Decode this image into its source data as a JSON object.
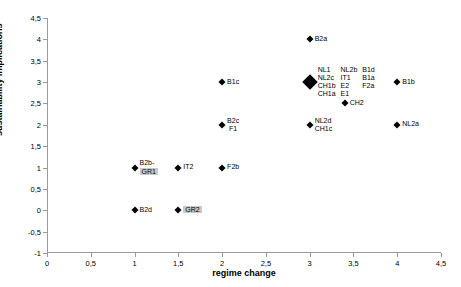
{
  "chart_data": {
    "type": "scatter",
    "title": "",
    "xlabel": "regime change",
    "ylabel": "sustainability implications",
    "xlim": [
      0,
      4.5
    ],
    "ylim": [
      -1,
      4.5
    ],
    "xticks": [
      "0",
      "0,5",
      "1",
      "1,5",
      "2",
      "2,5",
      "3",
      "3,5",
      "4",
      "4,5"
    ],
    "xtick_values": [
      0,
      0.5,
      1,
      1.5,
      2,
      2.5,
      3,
      3.5,
      4,
      4.5
    ],
    "yticks": [
      "4,5",
      "4",
      "3,5",
      "3",
      "2,5",
      "2",
      "1,5",
      "1",
      "0,5",
      "0",
      "-0,5",
      "-1"
    ],
    "ytick_values": [
      4.5,
      4,
      3.5,
      3,
      2.5,
      2,
      1.5,
      1,
      0.5,
      0,
      -0.5,
      -1
    ],
    "grid": false,
    "legend": "none",
    "points": [
      {
        "x": 3,
        "y": 4,
        "marker": "diamond",
        "labels": [
          [
            "B2a"
          ]
        ]
      },
      {
        "x": 3,
        "y": 3,
        "marker": "diamond-big",
        "labels": [
          [
            "NL1",
            "NL2c",
            "CH1b",
            "CH1a"
          ],
          [
            "NL2b",
            "IT1",
            "E2",
            "E1"
          ],
          [
            "B1d",
            "B1a",
            "F2a"
          ]
        ]
      },
      {
        "x": 2,
        "y": 3,
        "marker": "diamond",
        "labels": [
          [
            "B1c"
          ]
        ]
      },
      {
        "x": 4,
        "y": 3,
        "marker": "diamond",
        "labels": [
          [
            "B1b"
          ]
        ]
      },
      {
        "x": 3.4,
        "y": 2.5,
        "marker": "diamond",
        "labels": [
          [
            "CH2"
          ]
        ]
      },
      {
        "x": 2,
        "y": 2,
        "marker": "diamond",
        "labels": [
          [
            "B2c",
            "F1"
          ]
        ]
      },
      {
        "x": 3,
        "y": 2,
        "marker": "diamond",
        "labels": [
          [
            "NL2d",
            "CH1c"
          ]
        ]
      },
      {
        "x": 4,
        "y": 2,
        "marker": "diamond",
        "labels": [
          [
            "NL2a"
          ]
        ]
      },
      {
        "x": 1,
        "y": 1,
        "marker": "diamond",
        "labels": [
          [
            "B2b-",
            "GR1"
          ]
        ],
        "highlight": "GR1"
      },
      {
        "x": 1.5,
        "y": 1,
        "marker": "diamond",
        "labels": [
          [
            "IT2"
          ]
        ]
      },
      {
        "x": 2,
        "y": 1,
        "marker": "diamond",
        "labels": [
          [
            "F2b"
          ]
        ]
      },
      {
        "x": 1,
        "y": 0,
        "marker": "diamond",
        "labels": [
          [
            "B2d"
          ]
        ]
      },
      {
        "x": 1.5,
        "y": 0,
        "marker": "diamond",
        "labels": [
          [
            "GR2"
          ]
        ],
        "highlight": "GR2"
      }
    ]
  }
}
